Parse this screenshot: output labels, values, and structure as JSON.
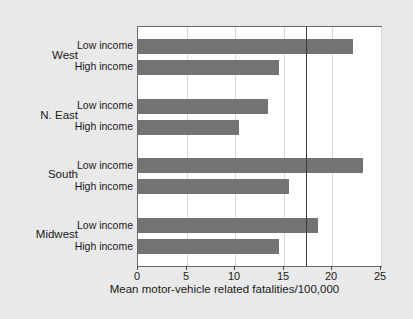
{
  "chart_data": {
    "type": "bar",
    "orientation": "horizontal",
    "title": "",
    "xlabel": "Mean motor-vehicle related fatalities/100,000",
    "ylabel": "",
    "xlim": [
      0,
      25
    ],
    "xticks": [
      0,
      5,
      10,
      15,
      20,
      25
    ],
    "xticklabels": [
      "0",
      "5",
      "10",
      "15",
      "20",
      "25"
    ],
    "grid": true,
    "grid_axis": "x",
    "legend": "none",
    "bar_color": "#737373",
    "plot_background": "#ffffff",
    "figure_background": "#e9e9e9",
    "reference_line": {
      "value": 17.3,
      "color": "#3a3a3a",
      "orientation": "vertical"
    },
    "groups": [
      {
        "label": "West",
        "bars": [
          {
            "label": "Low income",
            "value": 22.1
          },
          {
            "label": "High income",
            "value": 14.5
          }
        ]
      },
      {
        "label": "N. East",
        "bars": [
          {
            "label": "Low income",
            "value": 13.4
          },
          {
            "label": "High income",
            "value": 10.4
          }
        ]
      },
      {
        "label": "South",
        "bars": [
          {
            "label": "Low income",
            "value": 23.1
          },
          {
            "label": "High income",
            "value": 15.5
          }
        ]
      },
      {
        "label": "Midwest",
        "bars": [
          {
            "label": "Low income",
            "value": 18.5
          },
          {
            "label": "High income",
            "value": 14.5
          }
        ]
      }
    ],
    "categories": [
      "West Low income",
      "West High income",
      "N. East Low income",
      "N. East High income",
      "South Low income",
      "South High income",
      "Midwest Low income",
      "Midwest High income"
    ],
    "values": [
      22.1,
      14.5,
      13.4,
      10.4,
      23.1,
      15.5,
      18.5,
      14.5
    ]
  }
}
